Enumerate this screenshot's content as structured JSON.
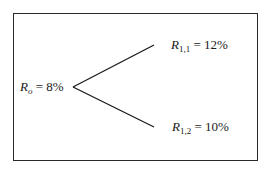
{
  "diagram": {
    "type": "binomial-tree",
    "frame": {
      "border_color": "#2a2a2a"
    },
    "root": {
      "symbol": "R",
      "subscript": "o",
      "equals": " = ",
      "value": "8%"
    },
    "branches": [
      {
        "id": "up",
        "symbol": "R",
        "subscript": "1,1",
        "equals": " = ",
        "value": "12%"
      },
      {
        "id": "down",
        "symbol": "R",
        "subscript": "1,2",
        "equals": " = ",
        "value": "10%"
      }
    ],
    "geometry": {
      "vertex": [
        73,
        87
      ],
      "up_end": [
        154,
        45
      ],
      "down_end": [
        154,
        127
      ]
    },
    "line_color": "#1a1a1a"
  }
}
